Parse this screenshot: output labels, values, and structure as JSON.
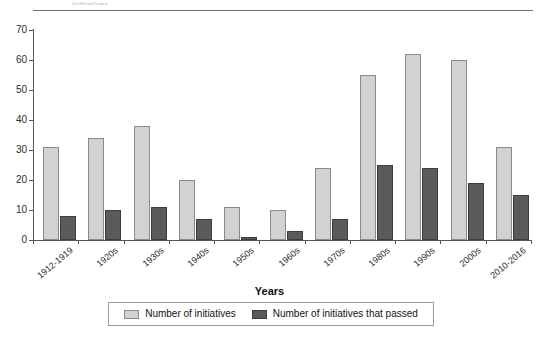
{
  "caption_sliver": "Initiatives",
  "chart_data": {
    "type": "bar",
    "title": "",
    "xlabel": "Years",
    "ylabel": "",
    "ylim": [
      0,
      70
    ],
    "yticks": [
      70,
      60,
      50,
      40,
      30,
      20,
      10,
      0
    ],
    "grid": false,
    "legend_position": "bottom",
    "categories": [
      "1912-1919",
      "1920s",
      "1930s",
      "1940s",
      "1950s",
      "1960s",
      "1970s",
      "1980s",
      "1990s",
      "2000s",
      "2010-2016"
    ],
    "series": [
      {
        "name": "Number of initiatives",
        "color": "#d2d2d2",
        "values": [
          31,
          34,
          38,
          20,
          11,
          10,
          24,
          55,
          62,
          60,
          31
        ]
      },
      {
        "name": "Number of initiatives that passed",
        "color": "#5b5b5b",
        "values": [
          8,
          10,
          11,
          7,
          1,
          3,
          7,
          25,
          24,
          19,
          15
        ]
      }
    ]
  }
}
